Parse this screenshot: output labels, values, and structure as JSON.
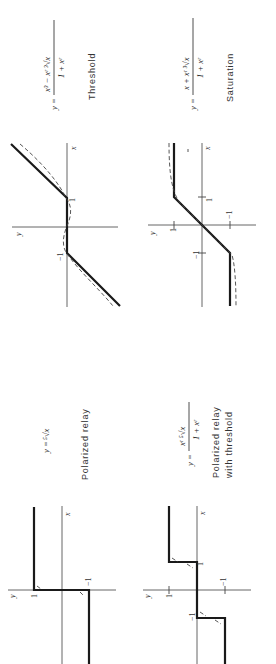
{
  "figure": {
    "orientation": "rotated 90 degrees counter-clockwise",
    "panels": [
      {
        "id": "threshold",
        "caption": "Threshold",
        "formula": {
          "lhs": "y =",
          "numerator": "x³ − xʳ ³√x",
          "denominator": "1 + xʳ"
        },
        "axis_labels": {
          "x": "x",
          "y": "y"
        },
        "ticks": [
          "−1",
          "1"
        ],
        "description": "Dead-zone characteristic: zero output between −1 and 1, linear slope outside; dashed approximating curve"
      },
      {
        "id": "saturation",
        "caption": "Saturation",
        "formula": {
          "lhs": "y =",
          "numerator": "x + xʳ ³√x",
          "denominator": "1 + xʳ"
        },
        "axis_labels": {
          "x": "x",
          "y": "y"
        },
        "ticks": [
          "−1",
          "1",
          "1",
          "−1"
        ],
        "description": "Linear between −1 and 1, saturating at ±1; dashed approximating curve"
      },
      {
        "id": "polarized-relay",
        "caption": "Polarized   relay",
        "formula": {
          "lhs": "y =",
          "expr": "⁵√x"
        },
        "axis_labels": {
          "x": "x",
          "y": "y"
        },
        "ticks": [
          "1",
          "−1"
        ],
        "description": "Sign function: output −1 for x<0, +1 for x>0"
      },
      {
        "id": "polarized-relay-threshold",
        "caption_line1": "Polarized relay",
        "caption_line2": "with threshold",
        "formula": {
          "lhs": "y =",
          "numerator": "xʳ ⁵√x",
          "denominator": "1 + xʳ"
        },
        "axis_labels": {
          "x": "x",
          "y": "y"
        },
        "ticks": [
          "1",
          "−1",
          "−1",
          "1"
        ],
        "description": "Relay with dead zone: 0 between −1 and 1, ±1 outside"
      }
    ]
  }
}
